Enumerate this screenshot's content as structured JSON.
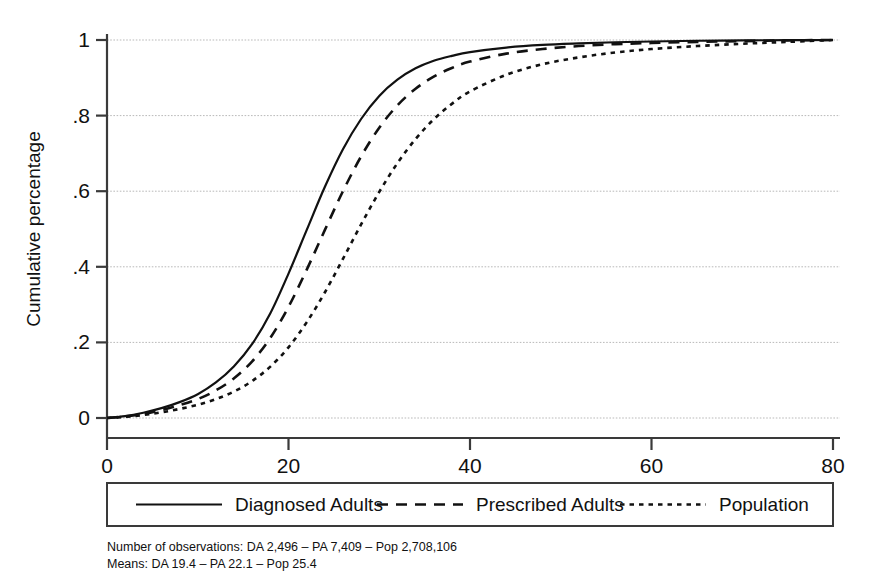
{
  "chart_data": {
    "type": "line",
    "title": "",
    "subtitle": "",
    "xlabel": "",
    "ylabel": "Cumulative percentage",
    "xlim": [
      0,
      80
    ],
    "ylim": [
      0,
      1.05
    ],
    "xticks": [
      "0",
      "20",
      "40",
      "60",
      "80"
    ],
    "xtick_values": [
      0,
      20,
      40,
      60,
      80
    ],
    "yticks": [
      "0",
      ".2",
      ".4",
      ".6",
      ".8",
      "1"
    ],
    "ytick_values": [
      0,
      0.2,
      0.4,
      0.6,
      0.8,
      1
    ],
    "grid": "horizontal-dotted",
    "legend_position": "below-axes",
    "x": [
      0,
      2,
      4,
      6,
      8,
      10,
      12,
      14,
      16,
      18,
      20,
      22,
      24,
      26,
      28,
      30,
      32,
      34,
      36,
      38,
      40,
      44,
      48,
      52,
      56,
      60,
      65,
      70,
      75,
      80
    ],
    "series": [
      {
        "name": "Diagnosed Adults",
        "style": "solid",
        "color": "#111111",
        "mean": 19.4,
        "observations": "2,496",
        "values": [
          0,
          0.005,
          0.014,
          0.026,
          0.042,
          0.063,
          0.094,
          0.137,
          0.196,
          0.277,
          0.382,
          0.497,
          0.611,
          0.711,
          0.791,
          0.852,
          0.895,
          0.925,
          0.945,
          0.958,
          0.968,
          0.98,
          0.987,
          0.991,
          0.994,
          0.996,
          0.998,
          0.999,
          0.9995,
          1.0
        ]
      },
      {
        "name": "Prescribed Adults",
        "style": "dashed",
        "color": "#111111",
        "mean": 22.1,
        "observations": "7,409",
        "values": [
          0,
          0.004,
          0.011,
          0.021,
          0.034,
          0.05,
          0.073,
          0.105,
          0.15,
          0.212,
          0.294,
          0.392,
          0.497,
          0.6,
          0.692,
          0.768,
          0.827,
          0.871,
          0.903,
          0.926,
          0.943,
          0.964,
          0.976,
          0.984,
          0.989,
          0.992,
          0.995,
          0.997,
          0.999,
          1.0
        ]
      },
      {
        "name": "Population",
        "style": "dotted",
        "color": "#111111",
        "mean": 25.4,
        "observations": "2,708,106",
        "values": [
          0,
          0.003,
          0.008,
          0.015,
          0.024,
          0.035,
          0.05,
          0.07,
          0.098,
          0.136,
          0.187,
          0.253,
          0.332,
          0.421,
          0.512,
          0.598,
          0.674,
          0.738,
          0.79,
          0.831,
          0.864,
          0.908,
          0.936,
          0.954,
          0.967,
          0.976,
          0.984,
          0.99,
          0.995,
          1.0
        ]
      }
    ],
    "legend_entries": [
      {
        "label": "Diagnosed Adults",
        "style": "solid"
      },
      {
        "label": "Prescribed Adults",
        "style": "dashed"
      },
      {
        "label": "Population",
        "style": "dotted"
      }
    ],
    "notes": [
      "Number of observations: DA 2,496 – PA 7,409 – Pop 2,708,106",
      "Means: DA 19.4 – PA 22.1 – Pop 25.4"
    ]
  }
}
